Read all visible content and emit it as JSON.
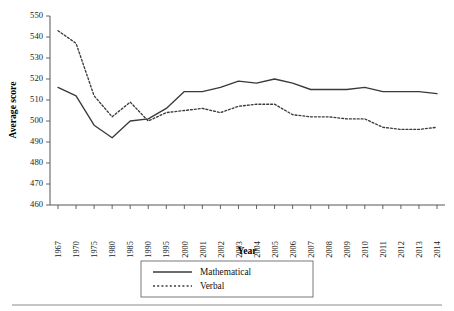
{
  "chart_data": {
    "type": "line",
    "title": "",
    "xlabel": "Year",
    "ylabel": "Average score",
    "ylim": [
      460,
      550
    ],
    "ytick_step": 10,
    "yticks": [
      460,
      470,
      480,
      490,
      500,
      510,
      520,
      530,
      540,
      550
    ],
    "grid": false,
    "legend_position": "below-axis-center",
    "categories": [
      "1967",
      "1970",
      "1975",
      "1980",
      "1985",
      "1990",
      "1995",
      "2000",
      "2001",
      "2002",
      "2003",
      "2004",
      "2005",
      "2006",
      "2007",
      "2008",
      "2009",
      "2010",
      "2011",
      "2012",
      "2013",
      "2014"
    ],
    "series": [
      {
        "name": "Mathematical",
        "style": "solid",
        "color": "#3a3a3a",
        "values": [
          516,
          512,
          498,
          492,
          500,
          501,
          506,
          514,
          514,
          516,
          519,
          518,
          520,
          518,
          515,
          515,
          515,
          516,
          514,
          514,
          514,
          513
        ]
      },
      {
        "name": "Verbal",
        "style": "dotted",
        "color": "#3a3a3a",
        "values": [
          543,
          537,
          512,
          502,
          509,
          500,
          504,
          505,
          506,
          504,
          507,
          508,
          508,
          503,
          502,
          502,
          501,
          501,
          497,
          496,
          496,
          497
        ]
      }
    ]
  },
  "legend": {
    "entries": [
      {
        "label": "Mathematical",
        "style": "solid"
      },
      {
        "label": "Verbal",
        "style": "dotted"
      }
    ]
  },
  "axes": {
    "y_title": "Average score",
    "x_title": "Year"
  }
}
